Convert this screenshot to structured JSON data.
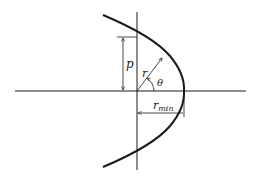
{
  "diagram": {
    "type": "parabola-polar-coordinates",
    "labels": {
      "p": "p",
      "r": "r",
      "theta": "θ",
      "r_min_base": "r",
      "r_min_sub": "min"
    },
    "colors": {
      "line": "#1a1a1a",
      "background": "#ffffff"
    }
  }
}
